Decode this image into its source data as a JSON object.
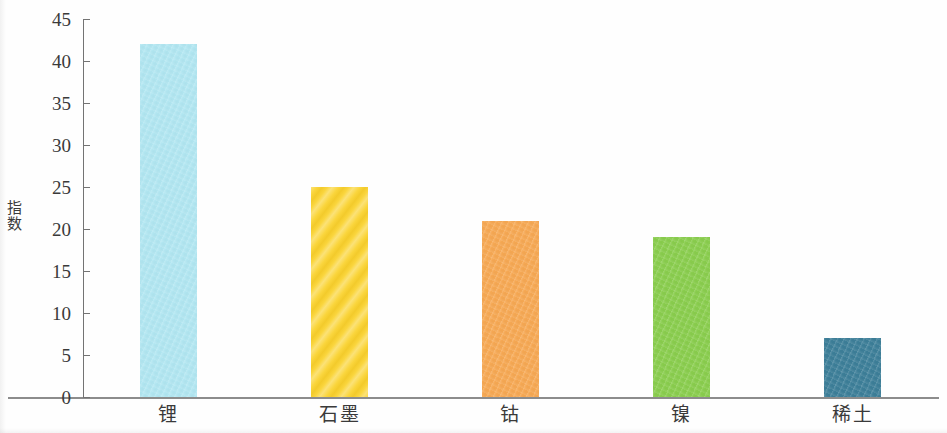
{
  "chart_data": {
    "type": "bar",
    "title": "",
    "xlabel": "",
    "ylabel": "指数",
    "categories": [
      "锂",
      "石墨",
      "钴",
      "镍",
      "稀土"
    ],
    "values": [
      42,
      25,
      21,
      19,
      7
    ],
    "series": [
      {
        "name": "指数",
        "values": [
          42,
          25,
          21,
          19,
          7
        ]
      }
    ],
    "bar_colors": [
      "#b2e7f2",
      "#fad331",
      "#f7a954",
      "#8ace4e",
      "#3d7f99"
    ],
    "bar_textures": [
      "grain",
      "diagonal-hatch",
      "grain",
      "grain",
      "grain"
    ],
    "ylim": [
      0,
      45
    ],
    "ytick_values": [
      0,
      5,
      10,
      15,
      20,
      25,
      30,
      35,
      40,
      45
    ],
    "ytick_labels": [
      "0",
      "5",
      "10",
      "15",
      "20",
      "25",
      "30",
      "35",
      "40",
      "45"
    ],
    "grid": false,
    "legend": false,
    "legend_position": "none",
    "annotations": []
  },
  "axes": {
    "y_title": "指数"
  }
}
